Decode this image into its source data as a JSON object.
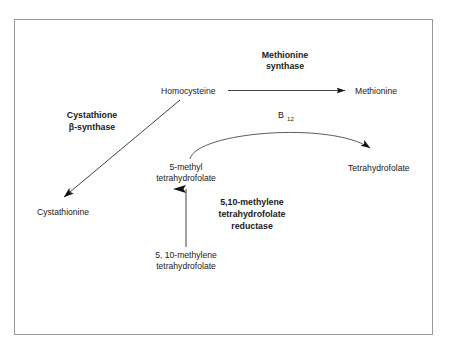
{
  "figure": {
    "type": "biochemical-pathway-diagram",
    "border_color": "#9a9a9a",
    "background": "#ffffff",
    "text_color": "#1a1a1a",
    "arrow_color": "#2b2b2b"
  },
  "metabolites": {
    "homocysteine": "Homocysteine",
    "methionine": "Methionine",
    "cystathionine": "Cystathionine",
    "tetrahydrofolate": "Tetrahydrofolate",
    "methyl_thf_line1": "5-methyl",
    "methyl_thf_line2": "tetrahydrofolate",
    "methylene_thf_line1": "5, 10-methylene",
    "methylene_thf_line2": "tetrahydrofolate"
  },
  "enzymes": {
    "methionine_synthase_line1": "Methionine",
    "methionine_synthase_line2": "synthase",
    "cystathione_synthase_line1": "Cystathione",
    "cystathione_synthase_line2": "β-synthase",
    "mthfr_line1": "5,10-methylene",
    "mthfr_line2": "tetrahydrofolate",
    "mthfr_line3": "reductase"
  },
  "cofactors": {
    "b12_symbol": "B",
    "b12_subscript": "12"
  },
  "arrows": {
    "homocysteine_to_methionine": "arrow-right",
    "homocysteine_to_cystathionine": "arrow-diagonal-down-left",
    "methylene_to_methyl": "arrow-up",
    "methyl_thf_to_thf": "arrow-curved-right"
  }
}
